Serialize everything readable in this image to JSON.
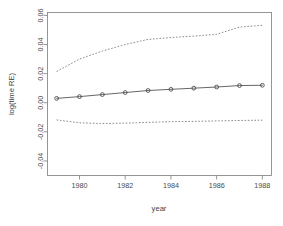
{
  "chart_data": {
    "type": "line",
    "title": "",
    "xlabel": "year",
    "ylabel": "log(time RE)",
    "xlim": [
      1978.6,
      1988.4
    ],
    "ylim": [
      -0.05,
      0.062
    ],
    "grid": false,
    "legend": null,
    "x_ticks": [
      1980,
      1982,
      1984,
      1986,
      1988
    ],
    "x_tick_labels": [
      "1980",
      "1982",
      "1984",
      "1986",
      "1988"
    ],
    "y_ticks": [
      -0.04,
      -0.02,
      0.0,
      0.02,
      0.04,
      0.06
    ],
    "y_tick_labels": [
      "-0.04",
      "-0.02",
      "0.00",
      "0.02",
      "0.04",
      "0.06"
    ],
    "x": [
      1979,
      1980,
      1981,
      1982,
      1983,
      1984,
      1985,
      1986,
      1987,
      1988
    ],
    "series": [
      {
        "name": "estimate",
        "style": "solid-with-circles",
        "values": [
          0.003,
          0.0042,
          0.0056,
          0.007,
          0.0084,
          0.0092,
          0.01,
          0.0108,
          0.0118,
          0.012
        ]
      },
      {
        "name": "upper-confidence-band",
        "style": "dashed",
        "values": [
          0.0215,
          0.03,
          0.0355,
          0.04,
          0.0435,
          0.0448,
          0.0458,
          0.047,
          0.052,
          0.0532
        ]
      },
      {
        "name": "lower-confidence-band",
        "style": "dashed",
        "values": [
          -0.0118,
          -0.0138,
          -0.0143,
          -0.014,
          -0.0135,
          -0.013,
          -0.0128,
          -0.0125,
          -0.0122,
          -0.012
        ]
      }
    ]
  },
  "colors": {
    "line": "#555555",
    "band": "#707070",
    "axis": "#8a8a8a",
    "text": "#4a4a4a",
    "background": "#ffffff"
  }
}
